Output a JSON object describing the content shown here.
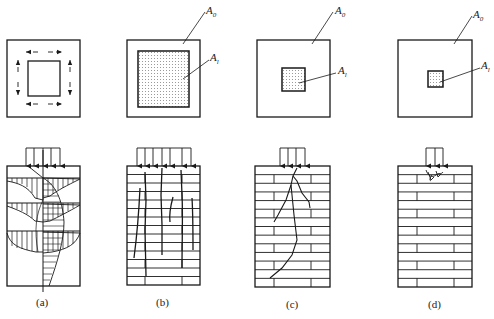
{
  "figure": {
    "panels": [
      {
        "id": "a",
        "caption": "(a)",
        "plan": {
          "inner_area_label": null,
          "outer_area_label": null,
          "description": "local area with lateral confining stress arrows around loaded core"
        },
        "elevation": {
          "description": "stress distribution diagram with hatched lateral stress regions and vertical load arrows",
          "load_arrows": 5
        }
      },
      {
        "id": "b",
        "caption": "(b)",
        "plan": {
          "outer_area_label_base": "A",
          "outer_area_label_sub": "0",
          "inner_area_label_base": "A",
          "inner_area_label_sub": "l"
        },
        "elevation": {
          "description": "brick wall with vertical splitting cracks along full height",
          "load_arrows": 7
        }
      },
      {
        "id": "c",
        "caption": "(c)",
        "plan": {
          "outer_area_label_base": "A",
          "outer_area_label_sub": "0",
          "inner_area_label_base": "A",
          "inner_area_label_sub": "l"
        },
        "elevation": {
          "description": "brick wall with crack propagating from under load",
          "load_arrows": 4
        }
      },
      {
        "id": "d",
        "caption": "(d)",
        "plan": {
          "outer_area_label_base": "A",
          "outer_area_label_sub": "0",
          "inner_area_label_base": "A",
          "inner_area_label_sub": "l"
        },
        "elevation": {
          "description": "brick wall with local crushing directly under small load",
          "load_arrows": 3
        }
      }
    ],
    "colors": {
      "line": "#1a1a1a",
      "background": "#ffffff",
      "dot_fill": "#9a9a9a"
    }
  }
}
